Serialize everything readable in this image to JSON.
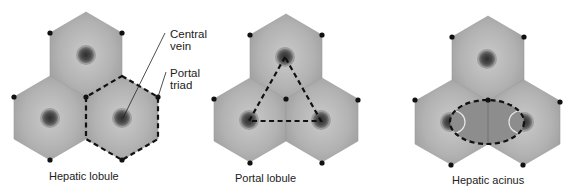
{
  "panels": [
    {
      "id": "hepatic-lobule",
      "caption": "Hepatic lobule"
    },
    {
      "id": "portal-lobule",
      "caption": "Portal lobule"
    },
    {
      "id": "hepatic-acinus",
      "caption": "Hepatic acinus"
    }
  ],
  "callouts": {
    "central_vein": {
      "line1": "Central",
      "line2": "vein"
    },
    "portal_triad": {
      "line1": "Portal",
      "line2": "triad"
    }
  },
  "colors": {
    "hexagon_fill": "#a9a9a9",
    "hexagon_center": "#c4c4c4",
    "vein": "#444444",
    "vein_ring": "#888888",
    "triad_dot": "#111111",
    "dashed_outline": "#111111",
    "acinus_fill": "#8e8e8e"
  }
}
